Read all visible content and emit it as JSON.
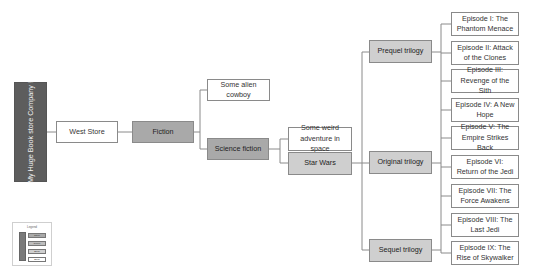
{
  "root": {
    "label": "My Huge Book store Company !"
  },
  "store": {
    "label": "West Store"
  },
  "genres": [
    {
      "label": "Fiction"
    },
    {
      "label": "Science fiction"
    }
  ],
  "fiction_children": [
    {
      "label": "Some alien cowboy"
    }
  ],
  "scifi_children": [
    {
      "label": "Some weird adventure in space"
    },
    {
      "label": "Star Wars"
    }
  ],
  "trilogies": [
    {
      "label": "Prequel trilogy"
    },
    {
      "label": "Original trilogy"
    },
    {
      "label": "Sequel trilogy"
    }
  ],
  "episodes": [
    {
      "label": "Episode I: The Phantom Menace"
    },
    {
      "label": "Episode II: Attack of the Clones"
    },
    {
      "label": "Episode III: Revenge of the Sith"
    },
    {
      "label": "Episode IV: A New Hope"
    },
    {
      "label": "Episode V: The Empire Strikes Back"
    },
    {
      "label": "Episode VI: Return of the Jedi"
    },
    {
      "label": "Episode VII: The Force Awakens"
    },
    {
      "label": "Episode VIII: The Last Jedi"
    },
    {
      "label": "Episode IX: The Rise of Skywalker"
    }
  ],
  "legend": {
    "title": "Legend",
    "items": [
      {
        "label": "Store"
      },
      {
        "label": "Genre"
      },
      {
        "label": "Book"
      },
      {
        "label": "Book"
      }
    ]
  },
  "colors": {
    "root": "#5d5d5d",
    "genre": "#a9a9a9",
    "series": "#cfcfcf",
    "leaf": "#ffffff",
    "line": "#8a8a8a"
  }
}
